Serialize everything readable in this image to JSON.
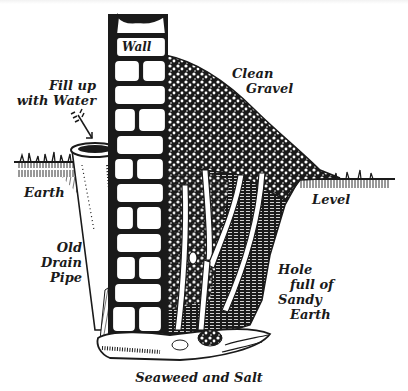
{
  "figure": {
    "type": "illustration",
    "style": "black ink pen drawing",
    "colors": {
      "ink": "#1a1a1a",
      "paper": "#ffffff"
    }
  },
  "labels": {
    "wall": "Wall",
    "gravel": {
      "line1": "Clean",
      "line2": "Gravel"
    },
    "fill": {
      "line1": "Fill up",
      "line2": "with Water"
    },
    "earth_left": "Earth",
    "level": "Level",
    "pipe": {
      "line1": "Old",
      "line2": "Drain",
      "line3": "Pipe"
    },
    "hole": {
      "line1": "Hole",
      "line2": "full of",
      "line3": "Sandy",
      "line4": "Earth"
    },
    "bottom": "Seaweed and Salt"
  },
  "parts": [
    "brick-wall",
    "gravel-mound",
    "drain-pipe",
    "ground-level-line",
    "plant-stems",
    "sandy-earth-hole",
    "seaweed-salt-base",
    "arrow-to-pipe"
  ]
}
